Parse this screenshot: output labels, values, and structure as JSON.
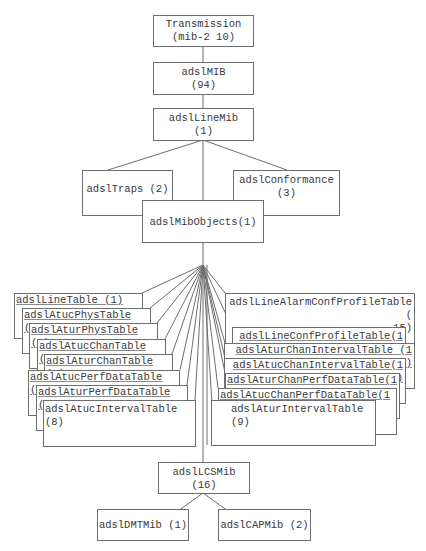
{
  "diagram": {
    "nodes": {
      "transmission": "Transmission\n(mib-2 10)",
      "adslMIB": "adslMIB\n(94)",
      "adslLineMib": "adslLineMib\n(1)",
      "adslTraps": "adslTraps (2)",
      "adslConformance": "adslConformance\n(3)",
      "adslMibObjects": "adslMibObjects(1)",
      "adslLCSMib": "adslLCSMib\n(16)",
      "adslDMTMib": "adslDMTMib (1)",
      "adslCAPMib": "adslCAPMib (2)"
    },
    "left_tables": [
      "adslLineTable (1)",
      "adslAtucPhysTable(2)",
      "adslAturPhysTable(3)",
      "adslAtucChanTable(4)",
      "adslAturChanTable(5)",
      "adslAtucPerfDataTable(6)",
      "adslAturPerfDataTable(7)",
      "adslAtucIntervalTable(8)"
    ],
    "right_tables": [
      "adslLineAlarmConfProfileTable(\n15)",
      "adslLineConfProfileTable(14)",
      "adslAturChanIntervalTable (13)",
      "adslAtucChanIntervalTable(12)",
      "adslAturChanPerfDataTable(11)",
      "adslAtucChanPerfDataTable(10)",
      "adslAturIntervalTable(9)"
    ]
  }
}
